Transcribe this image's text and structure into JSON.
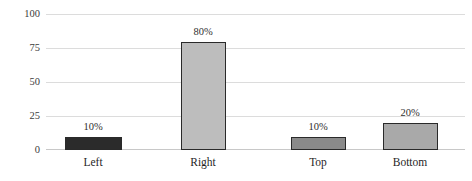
{
  "chart_data": {
    "type": "bar",
    "title": "",
    "subtitle": "",
    "xlabel": "",
    "ylabel": "",
    "categories": [
      "Left",
      "Right",
      "Top",
      "Bottom"
    ],
    "values": [
      10,
      80,
      10,
      20
    ],
    "data_labels": [
      "10%",
      "80%",
      "10%",
      "20%"
    ],
    "bar_colors": [
      "#2b2b2b",
      "#bdbdbd",
      "#8a8a8a",
      "#a9a9a9"
    ],
    "bar_border_color": "#2a2a2a",
    "ylim": [
      0,
      100
    ],
    "yticks": [
      0,
      25,
      50,
      75,
      100
    ],
    "ytick_labels": [
      "0",
      "25",
      "50",
      "75",
      "100"
    ],
    "grid": true,
    "grid_color": "#dcdcdc",
    "axis_color": "#c8c8c8",
    "legend": "none",
    "legend_position": "none"
  },
  "axis": {
    "y_labels": [
      "100",
      "75",
      "50",
      "25",
      "0"
    ]
  }
}
